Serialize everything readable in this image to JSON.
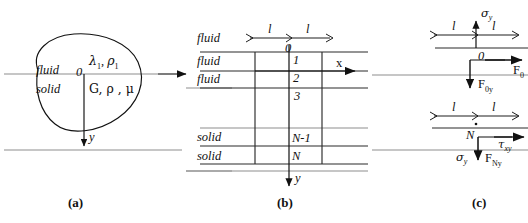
{
  "figure": {
    "panels": [
      {
        "id": "a",
        "caption": "(a)"
      },
      {
        "id": "b",
        "caption": "(b)"
      },
      {
        "id": "c",
        "caption": "(c)"
      }
    ]
  },
  "panel_a": {
    "region_upper_label": "fluid",
    "region_lower_label": "solid",
    "origin_label": "0",
    "upper_params": "λ",
    "upper_params_sub": "1",
    "upper_params_rho": "ρ",
    "upper_params_rho_sub": "1",
    "lower_params": "G, ρ , μ",
    "y_axis_label": "y",
    "axis_arrow_right": "x-direction-arrow"
  },
  "panel_b": {
    "dim_label_left": "l",
    "dim_label_right": "l",
    "row_labels": [
      "fluid",
      "fluid",
      "fluid",
      "solid",
      "solid"
    ],
    "node_labels": [
      "0",
      "1",
      "2",
      "3",
      "N-1",
      "N"
    ],
    "x_axis_label": "x",
    "y_axis_label": "y"
  },
  "panel_c": {
    "top": {
      "dim_label_left": "l",
      "dim_label_right": "l",
      "node_label": "0",
      "sigma": "σ",
      "sigma_sub": "y",
      "force_vertical": "F",
      "force_vertical_sub": "0y",
      "force_horizontal": "F",
      "force_horizontal_sub": "0"
    },
    "bottom": {
      "dim_label_left": "l",
      "dim_label_right": "l",
      "node_label": "N",
      "tau": "τ",
      "tau_sub": "xy",
      "sigma": "σ",
      "sigma_sub": "y",
      "force_vertical": "F",
      "force_vertical_sub": "Ny"
    }
  },
  "colors": {
    "ink": "#111111",
    "rule": "#8d8d8d",
    "grid": "#2b2b2b",
    "background": "#ffffff"
  }
}
